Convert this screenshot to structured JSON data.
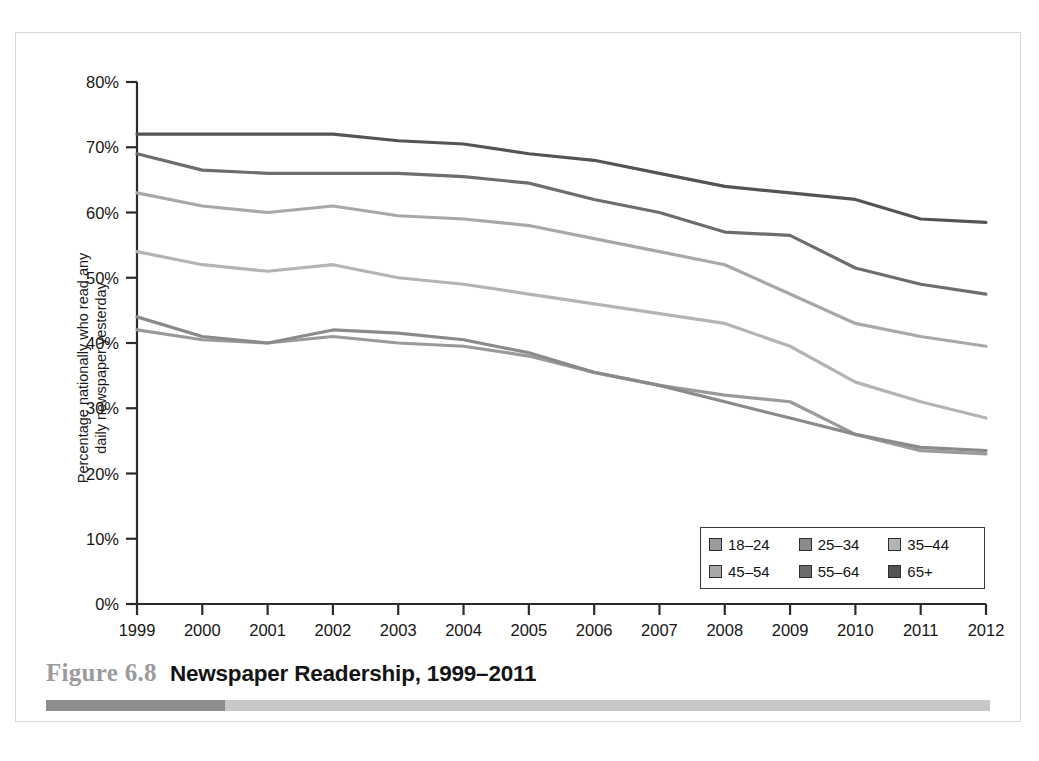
{
  "figure": {
    "number_label": "Figure 6.8",
    "title": "Newspaper Readership, 1999–2011"
  },
  "legend": {
    "position": "inside-bottom-right",
    "items": [
      {
        "label": "18–24",
        "color": "#9a9a9a"
      },
      {
        "label": "25–34",
        "color": "#8a8a8a"
      },
      {
        "label": "35–44",
        "color": "#b4b4b4"
      },
      {
        "label": "45–54",
        "color": "#a8a8a8"
      },
      {
        "label": "55–64",
        "color": "#6d6d6d"
      },
      {
        "label": "65+",
        "color": "#545454"
      }
    ]
  },
  "axes": {
    "y_title_line1": "Percentage nationally who read any",
    "y_title_line2": "daily newspaper yesterday",
    "y_ticks": [
      "0%",
      "10%",
      "20%",
      "30%",
      "40%",
      "50%",
      "60%",
      "70%",
      "80%"
    ],
    "x_ticks": [
      "1999",
      "2000",
      "2001",
      "2002",
      "2003",
      "2004",
      "2005",
      "2006",
      "2007",
      "2008",
      "2009",
      "2010",
      "2011",
      "2012"
    ]
  },
  "chart_data": {
    "type": "line",
    "title": "Newspaper Readership, 1999–2011",
    "xlabel": "",
    "ylabel": "Percentage nationally who read any daily newspaper yesterday",
    "x": [
      1999,
      2000,
      2001,
      2002,
      2003,
      2004,
      2005,
      2006,
      2007,
      2008,
      2009,
      2010,
      2011,
      2012
    ],
    "xlim": [
      1999,
      2012
    ],
    "ylim": [
      0,
      80
    ],
    "ytick_step": 10,
    "ytick_format": "percent",
    "grid": false,
    "legend_position": "lower right",
    "series": [
      {
        "name": "18–24",
        "color": "#9a9a9a",
        "values": [
          42,
          40.5,
          40,
          41,
          40,
          39.5,
          38,
          35.5,
          33.5,
          32,
          31,
          26,
          23.5,
          23
        ]
      },
      {
        "name": "25–34",
        "color": "#8a8a8a",
        "values": [
          44,
          41,
          40,
          42,
          41.5,
          40.5,
          38.5,
          35.5,
          33.5,
          31,
          28.5,
          26,
          24,
          23.5
        ]
      },
      {
        "name": "35–44",
        "color": "#b4b4b4",
        "values": [
          54,
          52,
          51,
          52,
          50,
          49,
          47.5,
          46,
          44.5,
          43,
          39.5,
          34,
          31,
          28.5
        ]
      },
      {
        "name": "45–54",
        "color": "#a8a8a8",
        "values": [
          63,
          61,
          60,
          61,
          59.5,
          59,
          58,
          56,
          54,
          52,
          47.5,
          43,
          41,
          39.5
        ]
      },
      {
        "name": "55–64",
        "color": "#6d6d6d",
        "values": [
          69,
          66.5,
          66,
          66,
          66,
          65.5,
          64.5,
          62,
          60,
          57,
          56.5,
          51.5,
          49,
          47.5
        ]
      },
      {
        "name": "65+",
        "color": "#545454",
        "values": [
          72,
          72,
          72,
          72,
          71,
          70.5,
          69,
          68,
          66,
          64,
          63,
          62,
          59,
          58.5
        ]
      }
    ]
  }
}
